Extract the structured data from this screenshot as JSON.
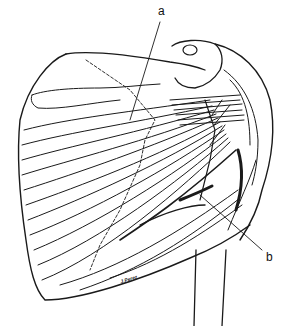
{
  "figure": {
    "labels": [
      {
        "id": "a",
        "text": "a",
        "x": 158,
        "y": 8
      },
      {
        "id": "b",
        "text": "b",
        "x": 266,
        "y": 254
      }
    ],
    "signature": "J.Perez",
    "colors": {
      "ink": "#1a1a1a",
      "background": "#ffffff"
    }
  }
}
